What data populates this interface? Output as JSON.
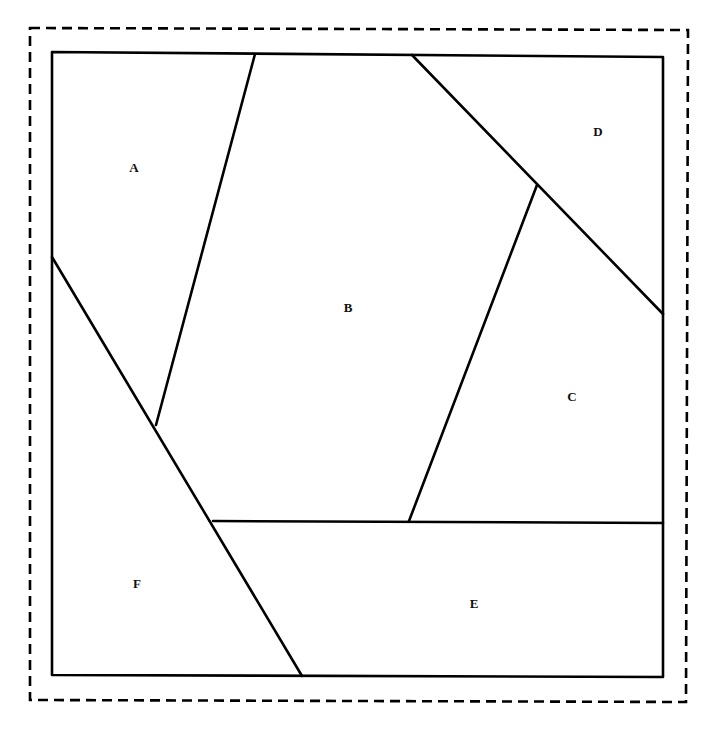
{
  "diagram": {
    "colors": {
      "line": "#000000",
      "background": "#ffffff",
      "label": "#111111"
    },
    "outer_border": {
      "style": "dashed",
      "points": [
        [
          30,
          28
        ],
        [
          688,
          30
        ],
        [
          686,
          702
        ],
        [
          30,
          700
        ]
      ]
    },
    "square": {
      "points": [
        [
          52,
          52
        ],
        [
          663,
          57
        ],
        [
          663,
          677
        ],
        [
          52,
          675
        ]
      ]
    },
    "regions": [
      {
        "id": "A",
        "label": "A",
        "label_pos": [
          134,
          172
        ],
        "polygon": [
          [
            52,
            52
          ],
          [
            255,
            54
          ],
          [
            156,
            425
          ],
          [
            52,
            257
          ]
        ]
      },
      {
        "id": "B",
        "label": "B",
        "label_pos": [
          348,
          312
        ],
        "polygon": [
          [
            255,
            54
          ],
          [
            412,
            55
          ],
          [
            537,
            185
          ],
          [
            409,
            521
          ],
          [
            213,
            521
          ],
          [
            156,
            425
          ]
        ]
      },
      {
        "id": "C",
        "label": "C",
        "label_pos": [
          572,
          401
        ],
        "polygon": [
          [
            537,
            185
          ],
          [
            663,
            314
          ],
          [
            663,
            523
          ],
          [
            409,
            521
          ]
        ]
      },
      {
        "id": "D",
        "label": "D",
        "label_pos": [
          598,
          136
        ],
        "polygon": [
          [
            412,
            55
          ],
          [
            663,
            57
          ],
          [
            663,
            314
          ],
          [
            537,
            185
          ]
        ]
      },
      {
        "id": "E",
        "label": "E",
        "label_pos": [
          474,
          608
        ],
        "polygon": [
          [
            213,
            521
          ],
          [
            663,
            523
          ],
          [
            663,
            677
          ],
          [
            302,
            676
          ]
        ]
      },
      {
        "id": "F",
        "label": "F",
        "label_pos": [
          137,
          588
        ],
        "polygon": [
          [
            52,
            257
          ],
          [
            156,
            425
          ],
          [
            213,
            521
          ],
          [
            302,
            676
          ],
          [
            52,
            675
          ]
        ]
      }
    ],
    "edges": [
      {
        "name": "edge-a-b",
        "from": [
          255,
          54
        ],
        "to": [
          156,
          425
        ]
      },
      {
        "name": "edge-f-diagonal",
        "from": [
          52,
          257
        ],
        "to": [
          302,
          676
        ]
      },
      {
        "name": "edge-b-d-c-diagonal",
        "from": [
          412,
          55
        ],
        "to": [
          663,
          314
        ]
      },
      {
        "name": "edge-b-c",
        "from": [
          537,
          185
        ],
        "to": [
          409,
          521
        ]
      },
      {
        "name": "edge-b-c-e",
        "from": [
          213,
          521
        ],
        "to": [
          663,
          523
        ]
      }
    ]
  }
}
